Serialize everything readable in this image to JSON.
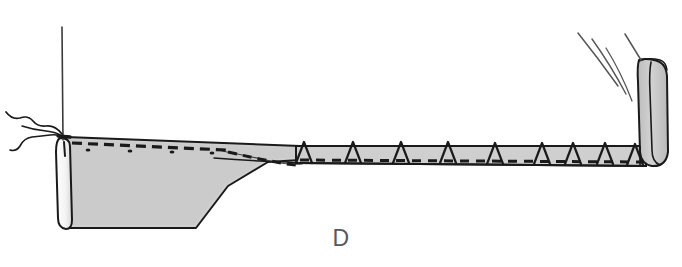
{
  "figure": {
    "step_label": "D",
    "background_color": "#ffffff",
    "fabric_fill": "#cfcfcf",
    "fabric_fill_dark": "#c3c3c3",
    "ink_color": "#1a1a1a",
    "label_color": "#58595b"
  },
  "parts": {
    "needle_thread_line": {
      "name": "vertical thread",
      "x": 62,
      "y_top": 27,
      "y_bottom": 140
    },
    "thread_squiggle": {
      "name": "loose thread tail",
      "x_start": 4,
      "x_end": 62,
      "y": 135
    },
    "left_rolled_edge": {
      "name": "rolled left hem edge",
      "x": 60,
      "y_top": 137,
      "y_bottom": 228,
      "width": 10
    },
    "main_body": {
      "name": "wide fabric panel",
      "x_left": 66,
      "x_right": 300,
      "y_top": 136,
      "y_bottom": 228
    },
    "taper": {
      "name": "tapered fold region",
      "x_start": 222,
      "x_end": 300
    },
    "narrow_strip": {
      "name": "folded hem strip",
      "x_left": 300,
      "x_right": 648,
      "y_top": 144,
      "y_bottom": 163
    },
    "right_rolled_end": {
      "name": "rolled right end",
      "x": 638,
      "y_top": 58,
      "y_bottom": 166,
      "width": 30
    },
    "motion_lines": {
      "name": "motion arcs",
      "count": 3
    },
    "dashed_stitch_line_body": {
      "name": "basting stitch line on panel",
      "dash_count": 13
    },
    "dashed_stitch_line_strip": {
      "name": "basting stitch line on strip",
      "dash_count": 30
    },
    "pin_marks": {
      "name": "pin / stitch triangles",
      "count": 9,
      "x_positions": [
        303,
        352,
        400,
        447,
        494,
        541,
        572,
        604,
        634
      ],
      "base_y": 163,
      "peak_y": 142
    },
    "fabric_dots": {
      "name": "texture dots",
      "count": 4,
      "x_positions": [
        88,
        130,
        172,
        212
      ],
      "y": 150
    }
  }
}
